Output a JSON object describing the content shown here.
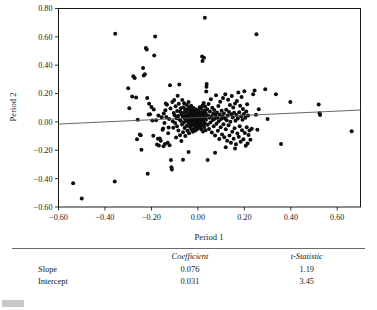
{
  "chart_data": {
    "type": "scatter",
    "title": "",
    "xlabel": "Period 1",
    "ylabel": "Period 2",
    "xlim": [
      -0.6,
      0.7
    ],
    "ylim": [
      -0.6,
      0.8
    ],
    "xticks": [
      -0.6,
      -0.4,
      -0.2,
      0.0,
      0.2,
      0.4,
      0.6
    ],
    "yticks": [
      -0.6,
      -0.4,
      -0.2,
      0.0,
      0.2,
      0.4,
      0.6,
      0.8
    ],
    "xtick_labels": [
      "−0.60",
      "−0.40",
      "−0.20",
      "0.00",
      "0.20",
      "0.40",
      "0.60"
    ],
    "ytick_labels": [
      "−0.60",
      "−0.40",
      "−0.20",
      "0.00",
      "0.20",
      "0.40",
      "0.60",
      "0.80"
    ],
    "grid": false,
    "legend": false,
    "fit_line": {
      "type": "linear",
      "slope": 0.076,
      "intercept": 0.031,
      "x_start": -0.6,
      "x_end": 0.7,
      "y_start": -0.015,
      "y_end": 0.084
    },
    "points": [
      [
        -0.537,
        -0.432
      ],
      [
        -0.5,
        -0.54
      ],
      [
        -0.358,
        -0.421
      ],
      [
        -0.356,
        0.622
      ],
      [
        -0.3,
        0.238
      ],
      [
        -0.295,
        0.096
      ],
      [
        -0.283,
        0.179
      ],
      [
        -0.278,
        0.322
      ],
      [
        -0.272,
        0.309
      ],
      [
        -0.266,
        0.172
      ],
      [
        -0.262,
        -0.122
      ],
      [
        -0.259,
        0.016
      ],
      [
        -0.25,
        -0.089
      ],
      [
        -0.246,
        -0.094
      ],
      [
        -0.243,
        -0.196
      ],
      [
        -0.236,
        0.38
      ],
      [
        -0.233,
        0.328
      ],
      [
        -0.228,
        0.336
      ],
      [
        -0.224,
        0.521
      ],
      [
        -0.22,
        0.511
      ],
      [
        -0.218,
        0.169
      ],
      [
        -0.216,
        -0.366
      ],
      [
        -0.212,
        0.052
      ],
      [
        -0.206,
        0.054
      ],
      [
        -0.2,
        0.106
      ],
      [
        -0.196,
        0.01
      ],
      [
        -0.192,
        -0.098
      ],
      [
        -0.188,
        0.468
      ],
      [
        -0.184,
        0.602
      ],
      [
        -0.18,
        0.012
      ],
      [
        -0.176,
        -0.16
      ],
      [
        -0.172,
        -0.118
      ],
      [
        -0.168,
        -0.166
      ],
      [
        -0.164,
        -0.116
      ],
      [
        -0.16,
        -0.132
      ],
      [
        -0.156,
        0.033
      ],
      [
        -0.152,
        -0.055
      ],
      [
        -0.15,
        -0.046
      ],
      [
        -0.147,
        0.06
      ],
      [
        -0.144,
        -0.008
      ],
      [
        -0.14,
        0.083
      ],
      [
        -0.138,
        0.13
      ],
      [
        -0.136,
        0.034
      ],
      [
        -0.133,
        0.121
      ],
      [
        -0.13,
        -0.146
      ],
      [
        -0.128,
        -0.08
      ],
      [
        -0.126,
        -0.04
      ],
      [
        -0.124,
        0.021
      ],
      [
        -0.122,
        -0.164
      ],
      [
        -0.12,
        0.258
      ],
      [
        -0.118,
        0.094
      ],
      [
        -0.116,
        -0.268
      ],
      [
        -0.114,
        -0.32
      ],
      [
        -0.112,
        -0.336
      ],
      [
        -0.11,
        0.141
      ],
      [
        -0.108,
        0.004
      ],
      [
        -0.106,
        -0.041
      ],
      [
        -0.104,
        0.063
      ],
      [
        -0.102,
        0.154
      ],
      [
        -0.1,
        0.047
      ],
      [
        -0.098,
        -0.007
      ],
      [
        -0.096,
        0.11
      ],
      [
        -0.094,
        -0.109
      ],
      [
        -0.092,
        0.026
      ],
      [
        -0.09,
        -0.03
      ],
      [
        -0.089,
        0.077
      ],
      [
        -0.087,
        0.185
      ],
      [
        -0.085,
        0.041
      ],
      [
        -0.084,
        -0.06
      ],
      [
        -0.082,
        0.128
      ],
      [
        -0.08,
        0.264
      ],
      [
        -0.079,
        0.017
      ],
      [
        -0.077,
        -0.094
      ],
      [
        -0.076,
        0.071
      ],
      [
        -0.074,
        0.008
      ],
      [
        -0.073,
        0.096
      ],
      [
        -0.071,
        -0.134
      ],
      [
        -0.07,
        0.054
      ],
      [
        -0.068,
        -0.018
      ],
      [
        -0.067,
        0.155
      ],
      [
        -0.065,
        0.038
      ],
      [
        -0.064,
        -0.072
      ],
      [
        -0.062,
        0.104
      ],
      [
        -0.061,
        -0.004
      ],
      [
        -0.06,
        0.066
      ],
      [
        -0.059,
        0.131
      ],
      [
        -0.057,
        -0.042
      ],
      [
        -0.056,
        0.022
      ],
      [
        -0.055,
        0.088
      ],
      [
        -0.054,
        -0.1
      ],
      [
        -0.052,
        0.045
      ],
      [
        -0.051,
        0.012
      ],
      [
        -0.05,
        0.074
      ],
      [
        -0.049,
        -0.028
      ],
      [
        -0.047,
        0.119
      ],
      [
        -0.046,
        0.036
      ],
      [
        -0.045,
        -0.063
      ],
      [
        -0.044,
        0.003
      ],
      [
        -0.043,
        0.092
      ],
      [
        -0.042,
        0.053
      ],
      [
        -0.041,
        -0.016
      ],
      [
        -0.04,
        0.14
      ],
      [
        -0.039,
        0.029
      ],
      [
        -0.038,
        -0.08
      ],
      [
        -0.037,
        0.064
      ],
      [
        -0.036,
        0.01
      ],
      [
        -0.035,
        0.101
      ],
      [
        -0.034,
        -0.036
      ],
      [
        -0.033,
        0.049
      ],
      [
        -0.032,
        0.078
      ],
      [
        -0.031,
        -0.009
      ],
      [
        -0.03,
        0.033
      ],
      [
        -0.029,
        0.114
      ],
      [
        -0.028,
        -0.054
      ],
      [
        -0.027,
        0.019
      ],
      [
        -0.026,
        0.068
      ],
      [
        -0.025,
        -0.024
      ],
      [
        -0.024,
        0.086
      ],
      [
        -0.023,
        0.007
      ],
      [
        -0.022,
        0.044
      ],
      [
        -0.021,
        -0.07
      ],
      [
        -0.02,
        0.026
      ],
      [
        -0.019,
        0.098
      ],
      [
        -0.018,
        -0.002
      ],
      [
        -0.017,
        0.057
      ],
      [
        -0.016,
        -0.044
      ],
      [
        -0.015,
        0.015
      ],
      [
        -0.014,
        0.073
      ],
      [
        -0.013,
        -0.019
      ],
      [
        -0.012,
        0.04
      ],
      [
        -0.011,
        0.09
      ],
      [
        -0.01,
        -0.061
      ],
      [
        -0.009,
        0.005
      ],
      [
        -0.008,
        0.052
      ],
      [
        -0.007,
        -0.031
      ],
      [
        -0.006,
        0.023
      ],
      [
        -0.005,
        0.079
      ],
      [
        -0.004,
        -0.012
      ],
      [
        -0.003,
        0.061
      ],
      [
        -0.002,
        0.031
      ],
      [
        -0.001,
        -0.048
      ],
      [
        0.0,
        0.009
      ],
      [
        0.001,
        0.046
      ],
      [
        0.002,
        0.085
      ],
      [
        0.003,
        -0.022
      ],
      [
        0.004,
        0.018
      ],
      [
        0.005,
        0.066
      ],
      [
        0.006,
        -0.006
      ],
      [
        0.007,
        0.037
      ],
      [
        0.008,
        0.103
      ],
      [
        0.009,
        -0.039
      ],
      [
        0.01,
        0.013
      ],
      [
        0.011,
        0.055
      ],
      [
        0.012,
        -0.015
      ],
      [
        0.013,
        0.028
      ],
      [
        0.014,
        0.095
      ],
      [
        0.015,
        -0.053
      ],
      [
        0.016,
        0.002
      ],
      [
        0.017,
        0.07
      ],
      [
        0.018,
        0.042
      ],
      [
        0.019,
        -0.026
      ],
      [
        0.02,
        0.116
      ],
      [
        0.021,
        0.021
      ],
      [
        0.022,
        -0.067
      ],
      [
        0.023,
        0.059
      ],
      [
        0.024,
        0.006
      ],
      [
        0.025,
        0.133
      ],
      [
        0.026,
        0.048
      ],
      [
        0.027,
        -0.035
      ],
      [
        0.028,
        0.024
      ],
      [
        0.029,
        0.081
      ],
      [
        0.03,
        -0.011
      ],
      [
        0.031,
        0.108
      ],
      [
        0.032,
        0.035
      ],
      [
        0.033,
        -0.058
      ],
      [
        0.034,
        0.063
      ],
      [
        0.035,
        0.016
      ],
      [
        0.036,
        0.215
      ],
      [
        0.037,
        0.248
      ],
      [
        0.038,
        0.268
      ],
      [
        0.03,
        0.734
      ],
      [
        0.026,
        0.452
      ],
      [
        0.02,
        0.43
      ],
      [
        0.018,
        0.462
      ],
      [
        0.04,
        0.09
      ],
      [
        0.042,
        -0.02
      ],
      [
        0.044,
        0.045
      ],
      [
        0.046,
        0.126
      ],
      [
        0.048,
        -0.049
      ],
      [
        0.05,
        0.03
      ],
      [
        0.052,
        0.073
      ],
      [
        0.054,
        -0.004
      ],
      [
        0.056,
        0.16
      ],
      [
        0.058,
        0.038
      ],
      [
        0.06,
        -0.074
      ],
      [
        0.062,
        0.1
      ],
      [
        0.064,
        0.014
      ],
      [
        0.066,
        0.057
      ],
      [
        0.068,
        -0.03
      ],
      [
        0.07,
        0.084
      ],
      [
        0.072,
        0.022
      ],
      [
        0.074,
        -0.095
      ],
      [
        0.076,
        0.048
      ],
      [
        0.078,
        0.189
      ],
      [
        0.08,
        -0.012
      ],
      [
        0.082,
        0.066
      ],
      [
        0.084,
        0.03
      ],
      [
        0.086,
        -0.062
      ],
      [
        0.088,
        0.112
      ],
      [
        0.09,
        0.004
      ],
      [
        0.092,
        -0.12
      ],
      [
        0.094,
        0.052
      ],
      [
        0.096,
        0.142
      ],
      [
        0.098,
        -0.038
      ],
      [
        0.1,
        0.02
      ],
      [
        0.102,
        0.078
      ],
      [
        0.104,
        -0.088
      ],
      [
        0.106,
        0.036
      ],
      [
        0.108,
        0.168
      ],
      [
        0.11,
        -0.016
      ],
      [
        0.112,
        0.06
      ],
      [
        0.114,
        -0.108
      ],
      [
        0.116,
        0.026
      ],
      [
        0.118,
        0.196
      ],
      [
        0.12,
        -0.052
      ],
      [
        0.122,
        0.086
      ],
      [
        0.124,
        0.012
      ],
      [
        0.126,
        -0.132
      ],
      [
        0.128,
        0.044
      ],
      [
        0.13,
        0.156
      ],
      [
        0.132,
        -0.024
      ],
      [
        0.134,
        0.07
      ],
      [
        0.136,
        -0.096
      ],
      [
        0.138,
        0.12
      ],
      [
        0.14,
        0.002
      ],
      [
        0.142,
        -0.146
      ],
      [
        0.144,
        0.054
      ],
      [
        0.146,
        0.182
      ],
      [
        0.148,
        -0.07
      ],
      [
        0.15,
        0.032
      ],
      [
        0.152,
        0.102
      ],
      [
        0.154,
        -0.118
      ],
      [
        0.156,
        0.064
      ],
      [
        0.158,
        -0.044
      ],
      [
        0.16,
        0.13
      ],
      [
        0.162,
        0.008
      ],
      [
        0.164,
        -0.158
      ],
      [
        0.166,
        0.048
      ],
      [
        0.168,
        0.148
      ],
      [
        0.17,
        -0.082
      ],
      [
        0.172,
        0.024
      ],
      [
        0.174,
        0.208
      ],
      [
        0.176,
        -0.104
      ],
      [
        0.178,
        0.068
      ],
      [
        0.18,
        -0.03
      ],
      [
        0.182,
        0.114
      ],
      [
        0.184,
        -0.14
      ],
      [
        0.186,
        0.04
      ],
      [
        0.188,
        0.176
      ],
      [
        0.19,
        -0.058
      ],
      [
        0.192,
        0.016
      ],
      [
        0.194,
        0.092
      ],
      [
        0.196,
        -0.122
      ],
      [
        0.198,
        0.056
      ],
      [
        0.2,
        0.216
      ],
      [
        0.202,
        -0.078
      ],
      [
        0.204,
        0.03
      ],
      [
        0.206,
        -0.168
      ],
      [
        0.208,
        0.074
      ],
      [
        0.21,
        -0.038
      ],
      [
        0.212,
        0.124
      ],
      [
        0.214,
        -0.152
      ],
      [
        0.216,
        0.046
      ],
      [
        0.218,
        -0.092
      ],
      [
        0.222,
        -0.06
      ],
      [
        0.226,
        -0.126
      ],
      [
        0.232,
        -0.048
      ],
      [
        0.238,
        0.196
      ],
      [
        0.244,
        0.221
      ],
      [
        0.25,
        0.05
      ],
      [
        0.252,
        0.618
      ],
      [
        0.256,
        -0.056
      ],
      [
        0.262,
        0.09
      ],
      [
        0.29,
        0.231
      ],
      [
        0.3,
        0.02
      ],
      [
        0.336,
        0.196
      ],
      [
        0.358,
        -0.156
      ],
      [
        0.398,
        0.14
      ],
      [
        0.52,
        0.123
      ],
      [
        0.524,
        0.062
      ],
      [
        0.526,
        0.048
      ],
      [
        0.662,
        -0.066
      ],
      [
        -0.148,
        -0.172
      ],
      [
        -0.142,
        -0.156
      ],
      [
        -0.064,
        -0.266
      ],
      [
        -0.04,
        -0.212
      ],
      [
        0.042,
        -0.268
      ],
      [
        0.074,
        -0.218
      ],
      [
        0.12,
        -0.178
      ],
      [
        0.16,
        -0.188
      ],
      [
        -0.21,
        0.128
      ],
      [
        -0.19,
        0.088
      ],
      [
        -0.17,
        0.046
      ]
    ]
  },
  "stats_table": {
    "columns": [
      "",
      "Coefficient",
      "t-Statistic"
    ],
    "rows": [
      {
        "label": "Slope",
        "coefficient": "0.076",
        "t_statistic": "1.19"
      },
      {
        "label": "Intercept",
        "coefficient": "0.031",
        "t_statistic": "3.45"
      }
    ]
  }
}
